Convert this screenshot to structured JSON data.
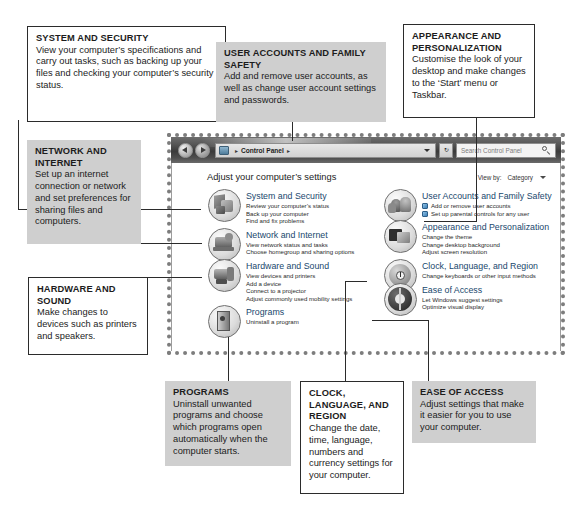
{
  "callouts": [
    {
      "id": "system-and-security",
      "heading": "SYSTEM AND SECURITY",
      "body": "View your computer’s specifications and carry out tasks, such as backing up your files and checking your computer’s security status."
    },
    {
      "id": "user-accounts-and-family-safety",
      "heading": "USER ACCOUNTS AND FAMILY SAFETY",
      "body": "Add and remove user accounts, as well as change user account settings and passwords."
    },
    {
      "id": "appearance-and-personalization",
      "heading": "APPEARANCE AND PERSONALIZATION",
      "body": "Customise the look of your desktop and make changes to the ‘Start’ menu or Taskbar."
    },
    {
      "id": "network-and-internet",
      "heading": "NETWORK AND INTERNET",
      "body": "Set up an internet connection or network and set preferences for sharing files and computers."
    },
    {
      "id": "hardware-and-sound",
      "heading": "HARDWARE AND SOUND",
      "body": "Make changes to devices such as printers and speakers."
    },
    {
      "id": "programs",
      "heading": "PROGRAMS",
      "body": "Uninstall unwanted programs and choose which programs open automatically when the computer starts."
    },
    {
      "id": "clock-language-and-region",
      "heading": "CLOCK, LANGUAGE, AND REGION",
      "body": "Change the date, time, language, numbers and currency settings for your computer."
    },
    {
      "id": "ease-of-access",
      "heading": "EASE OF ACCESS",
      "body": "Adjust settings that make it easier for you to use your computer."
    }
  ],
  "window": {
    "titlebar": {
      "back_icon": "back-arrow-icon",
      "forward_icon": "forward-arrow-icon",
      "address_icon": "control-panel-icon",
      "breadcrumb_sep_left": "▸",
      "address_label": "Control Panel",
      "breadcrumb_sep_right": "▸",
      "address_dropdown_icon": "chevron-down-icon",
      "refresh_label": "↻",
      "search_placeholder": "Search Control Panel",
      "search_icon": "search-icon"
    },
    "page_heading": "Adjust your computer’s settings",
    "view_by": {
      "label": "View by:",
      "value": "Category",
      "caret_icon": "chevron-down-icon"
    },
    "left_column": [
      {
        "icon": "system-and-security-icon",
        "title": "System and Security",
        "links": [
          "Review your computer’s status",
          "Back up your computer",
          "Find and fix problems"
        ]
      },
      {
        "icon": "network-and-internet-icon",
        "title": "Network and Internet",
        "links": [
          "View network status and tasks",
          "Choose homegroup and sharing options"
        ]
      },
      {
        "icon": "hardware-and-sound-icon",
        "title": "Hardware and Sound",
        "links": [
          "View devices and printers",
          "Add a device",
          "Connect to a projector",
          "Adjust commonly used mobility settings"
        ]
      },
      {
        "icon": "programs-icon",
        "title": "Programs",
        "links": [
          "Uninstall a program"
        ]
      }
    ],
    "right_column": [
      {
        "icon": "user-accounts-icon",
        "title": "User Accounts and Family Safety",
        "links": [
          "Add or remove user accounts",
          "Set up parental controls for any user"
        ],
        "shielded": true
      },
      {
        "icon": "appearance-icon",
        "title": "Appearance and Personalization",
        "links": [
          "Change the theme",
          "Change desktop background",
          "Adjust screen resolution"
        ]
      },
      {
        "icon": "clock-language-region-icon",
        "title": "Clock, Language, and Region",
        "links": [
          "Change keyboards or other input methods"
        ]
      },
      {
        "icon": "ease-of-access-icon",
        "title": "Ease of Access",
        "links": [
          "Let Windows suggest settings",
          "Optimize visual display"
        ]
      }
    ]
  },
  "colors": {
    "callout_shaded_bg": "#cfcfcf",
    "callout_outline_border": "#2b2b2b",
    "leader_line": "#2b2b2b",
    "link_title": "#20486d",
    "titlebar_dark": "#3a3a3a"
  }
}
